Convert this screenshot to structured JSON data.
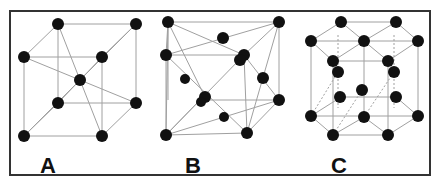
{
  "figure": {
    "panels": [
      {
        "label": "A",
        "structure": "body-centered cubic"
      },
      {
        "label": "B",
        "structure": "face-centered cubic"
      },
      {
        "label": "C",
        "structure": "hexagonal close-packed"
      }
    ],
    "colors": {
      "atom": "#111111",
      "bond": "#999999",
      "border": "#333333"
    }
  }
}
